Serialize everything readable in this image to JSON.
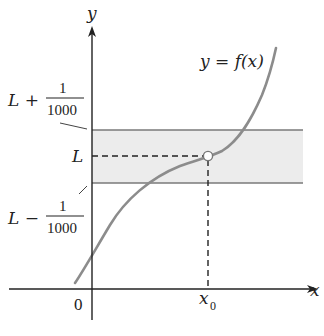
{
  "diagram": {
    "type": "limit-epsilon-band",
    "axes": {
      "x_label": "x",
      "y_label": "y",
      "origin_label": "0"
    },
    "curve": {
      "label": "y = f(x)",
      "color": "#8c8c8c"
    },
    "band": {
      "fill": "#ececec",
      "edge_color": "#7a7a7a",
      "upper_label_prefix": "L +",
      "lower_label_prefix": "L −",
      "fraction_numerator": "1",
      "fraction_denominator": "1000"
    },
    "limit_label": "L",
    "point": {
      "x_label": "x",
      "x_subscript": "0",
      "style": "open-circle"
    }
  }
}
